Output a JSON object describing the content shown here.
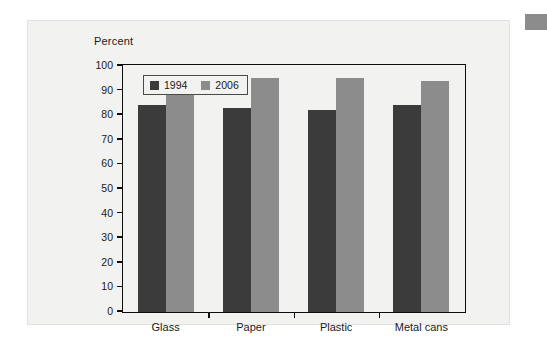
{
  "figure": {
    "axis_title": "Percent",
    "corner_marker_color": "#8c8c8c",
    "panel_color": "#f2f2f0"
  },
  "legend": {
    "items": [
      {
        "label": "1994",
        "color": "#3b3b3b",
        "swatch": "legend-swatch-1994"
      },
      {
        "label": "2006",
        "color": "#8c8c8c",
        "swatch": "legend-swatch-2006"
      }
    ]
  },
  "chart_data": {
    "type": "bar",
    "title": "",
    "xlabel": "",
    "ylabel": "Percent",
    "ylim": [
      0,
      100
    ],
    "yticks": [
      0,
      10,
      20,
      30,
      40,
      50,
      60,
      70,
      80,
      90,
      100
    ],
    "ytick_labels": [
      "0",
      "10",
      "20",
      "30",
      "40",
      "50",
      "60",
      "70",
      "80",
      "90",
      "100"
    ],
    "grid": false,
    "legend_position": "upper-left-inside",
    "categories": [
      "Glass",
      "Paper",
      "Plastic",
      "Metal cans"
    ],
    "series": [
      {
        "name": "1994",
        "color": "#3b3b3b",
        "values": [
          84,
          83,
          82,
          84
        ]
      },
      {
        "name": "2006",
        "color": "#8c8c8c",
        "values": [
          94,
          95,
          95,
          94
        ]
      }
    ]
  }
}
